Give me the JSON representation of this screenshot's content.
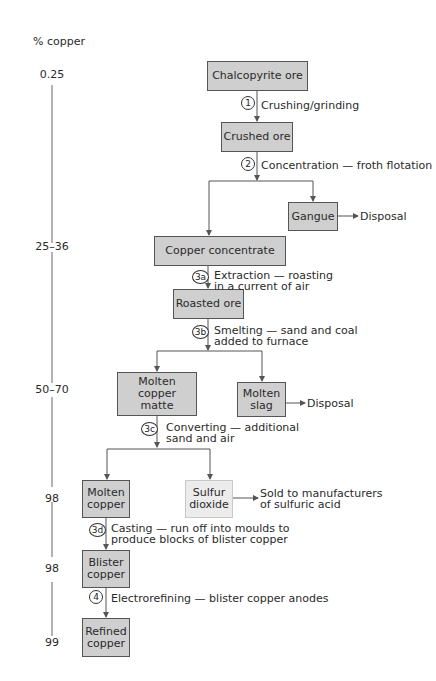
{
  "axis": {
    "title": "% copper",
    "levels": [
      "0.25",
      "25–36",
      "50–70",
      "98",
      "98",
      "99"
    ]
  },
  "nodes": {
    "chalcopyrite_ore": "Chalcopyrite ore",
    "crushed_ore": "Crushed ore",
    "gangue": "Gangue",
    "copper_concentrate": "Copper concentrate",
    "roasted_ore": "Roasted ore",
    "molten_copper_matte_l1": "Molten copper",
    "molten_copper_matte_l2": "matte",
    "molten_slag_l1": "Molten",
    "molten_slag_l2": "slag",
    "molten_copper_l1": "Molten",
    "molten_copper_l2": "copper",
    "sulfur_dioxide_l1": "Sulfur",
    "sulfur_dioxide_l2": "dioxide",
    "blister_copper_l1": "Blister",
    "blister_copper_l2": "copper",
    "refined_copper_l1": "Refined",
    "refined_copper_l2": "copper"
  },
  "steps": [
    {
      "num": "1",
      "text_l1": "Crushing/grinding",
      "text_l2": ""
    },
    {
      "num": "2",
      "text_l1": "Concentration — froth flotation",
      "text_l2": ""
    },
    {
      "num": "3a",
      "text_l1": "Extraction — roasting",
      "text_l2": "in a current of air"
    },
    {
      "num": "3b",
      "text_l1": "Smelting — sand and coal",
      "text_l2": "added to furnace"
    },
    {
      "num": "3c",
      "text_l1": "Converting — additional",
      "text_l2": "sand and air"
    },
    {
      "num": "3d",
      "text_l1": "Casting — run off into moulds to",
      "text_l2": "produce blocks of blister copper"
    },
    {
      "num": "4",
      "text_l1": "Electrorefining — blister copper anodes",
      "text_l2": ""
    }
  ],
  "outputs": {
    "gangue_dest": "Disposal",
    "slag_dest": "Disposal",
    "so2_dest_l1": "Sold to manufacturers",
    "so2_dest_l2": "of sulfuric acid"
  },
  "colors": {
    "box_fill": "#cfcfcf",
    "box_border": "#555555",
    "light_box_fill": "#ececec",
    "line": "#555555"
  }
}
